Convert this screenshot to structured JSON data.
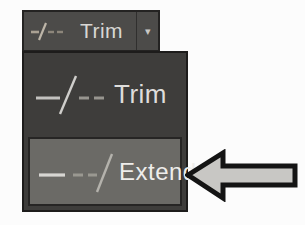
{
  "toolbar_button": {
    "label": "Trim",
    "icon": "trim-icon",
    "caret": "▾"
  },
  "dropdown": {
    "items": [
      {
        "label": "Trim",
        "icon": "trim-icon",
        "state": "normal"
      },
      {
        "label": "Extend",
        "icon": "extend-icon",
        "state": "highlighted"
      }
    ]
  },
  "annotation": {
    "shape": "left-pointing-block-arrow",
    "points_to": "Extend"
  },
  "colors": {
    "page_bg": "#fcfcfc",
    "button_bg": "#4c4b49",
    "panel_bg": "#3e3d3b",
    "highlight_bg": "#6b6a66",
    "border_dark": "#1d1c1b",
    "text_light": "#dedddb",
    "arrow_fill": "#c8c7c4",
    "arrow_outline": "#141414"
  }
}
